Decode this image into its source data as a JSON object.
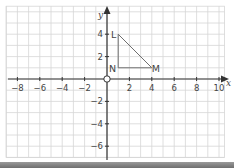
{
  "graph": {
    "axes": {
      "x_label": "x",
      "y_label": "y",
      "x_ticks": [
        -8,
        -6,
        -4,
        -2,
        2,
        4,
        6,
        8,
        10
      ],
      "y_ticks": [
        4,
        2,
        -2,
        -4,
        -6
      ],
      "origin_label": "O"
    },
    "grid": {
      "x_min": -9,
      "x_max": 10.5,
      "y_min": -7,
      "y_max": 6.5,
      "step": 1
    },
    "shape": {
      "name": "triangle LMN",
      "vertices": [
        {
          "label": "L",
          "x": 1,
          "y": 4
        },
        {
          "label": "M",
          "x": 4,
          "y": 1
        },
        {
          "label": "N",
          "x": 1,
          "y": 1
        }
      ]
    },
    "colors": {
      "grid": "#d6d6d6",
      "axis": "#333333",
      "shape": "#6e6e6e",
      "text": "#444444"
    }
  }
}
